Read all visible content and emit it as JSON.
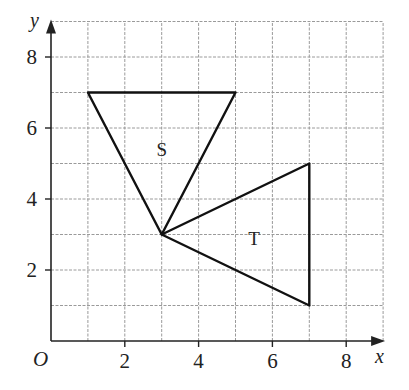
{
  "diagram": {
    "type": "coordinate-grid",
    "axes": {
      "x_label": "x",
      "y_label": "y",
      "origin_label": "O",
      "x_ticks": [
        {
          "value": 2,
          "label": "2"
        },
        {
          "value": 4,
          "label": "4"
        },
        {
          "value": 6,
          "label": "6"
        },
        {
          "value": 8,
          "label": "8"
        }
      ],
      "y_ticks": [
        {
          "value": 2,
          "label": "2"
        },
        {
          "value": 4,
          "label": "4"
        },
        {
          "value": 6,
          "label": "6"
        },
        {
          "value": 8,
          "label": "8"
        }
      ],
      "x_range": [
        0,
        9
      ],
      "y_range": [
        0,
        9
      ]
    },
    "shapes": [
      {
        "name": "S",
        "label": "S",
        "vertices": [
          [
            1,
            7
          ],
          [
            5,
            7
          ],
          [
            3,
            3
          ]
        ],
        "label_pos": [
          3,
          5.4
        ]
      },
      {
        "name": "T",
        "label": "T",
        "vertices": [
          [
            3,
            3
          ],
          [
            7,
            5
          ],
          [
            7,
            1
          ]
        ],
        "label_pos": [
          5.5,
          2.9
        ]
      }
    ],
    "colors": {
      "grid": "#9a9a9a",
      "axis": "#222222",
      "shape_stroke": "#111111"
    }
  }
}
